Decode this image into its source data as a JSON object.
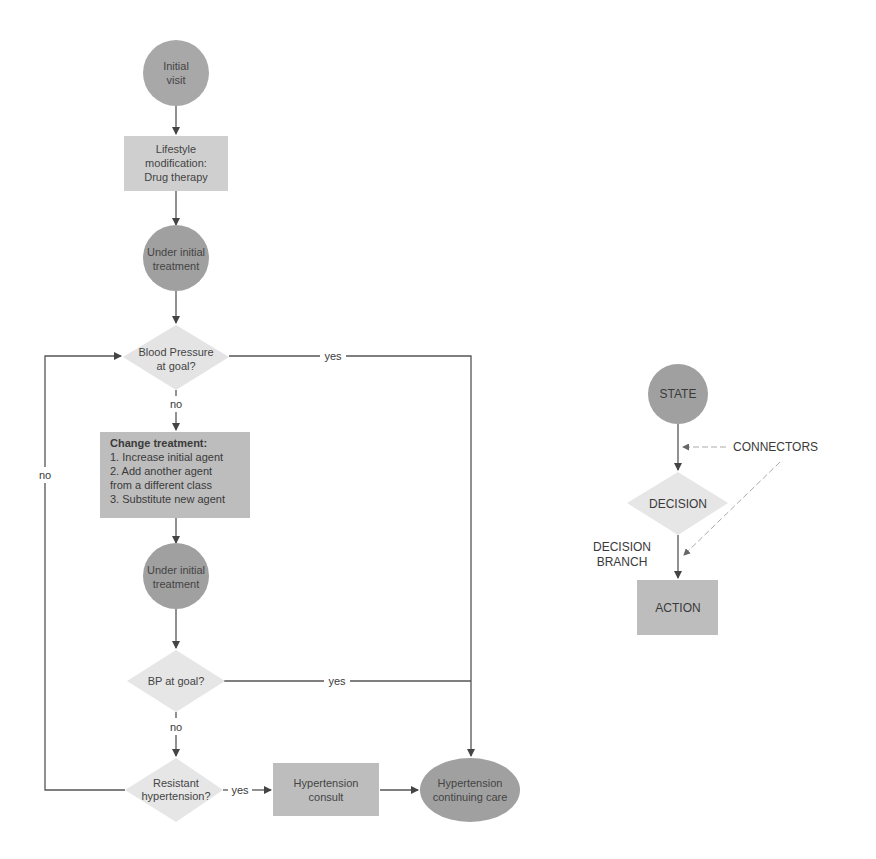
{
  "colors": {
    "state": "#a8a8a8",
    "action": "#cacaca",
    "action_dark": "#bdbdbd",
    "decision": "#e6e6e6",
    "edge": "#555555",
    "text": "#444444"
  },
  "flowchart": {
    "nodes": {
      "initial_visit": {
        "type": "state",
        "lines": [
          "Initial",
          "visit"
        ]
      },
      "lifestyle": {
        "type": "action",
        "lines": [
          "Lifestyle",
          "modification:",
          "Drug therapy"
        ]
      },
      "under_initial_1": {
        "type": "state",
        "lines": [
          "Under initial",
          "treatment"
        ]
      },
      "bp_goal_1": {
        "type": "decision",
        "lines": [
          "Blood Pressure",
          "at goal?"
        ]
      },
      "change_treatment": {
        "type": "action",
        "title": "Change treatment:",
        "lines": [
          "1. Increase initial agent",
          "2. Add another agent",
          "from a different class",
          "3. Substitute new agent"
        ]
      },
      "under_initial_2": {
        "type": "state",
        "lines": [
          "Under initial",
          "treatment"
        ]
      },
      "bp_goal_2": {
        "type": "decision",
        "lines": [
          "BP at goal?"
        ]
      },
      "resistant": {
        "type": "decision",
        "lines": [
          "Resistant",
          "hypertension?"
        ]
      },
      "consult": {
        "type": "action",
        "lines": [
          "Hypertension",
          "consult"
        ]
      },
      "continuing_care": {
        "type": "state",
        "lines": [
          "Hypertension",
          "continuing care"
        ]
      }
    },
    "edge_labels": {
      "bp1_yes": "yes",
      "bp1_no": "no",
      "loop_no": "no",
      "bp2_yes": "yes",
      "bp2_no": "no",
      "resistant_yes": "yes"
    }
  },
  "legend": {
    "state": "STATE",
    "decision": "DECISION",
    "action": "ACTION",
    "connectors": "CONNECTORS",
    "decision_branch_line1": "DECISION",
    "decision_branch_line2": "BRANCH"
  }
}
